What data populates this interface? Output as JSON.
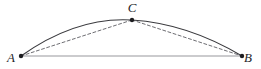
{
  "figure": {
    "kind": "geometry-diagram",
    "background_color": "#ffffff",
    "width": 261,
    "height": 69,
    "points": [
      {
        "id": "A",
        "label": "A",
        "x": 21,
        "y": 56,
        "label_x": 11,
        "label_y": 62,
        "marker": "filled-dot"
      },
      {
        "id": "B",
        "label": "B",
        "x": 242,
        "y": 56,
        "label_x": 248,
        "label_y": 62,
        "marker": "filled-dot"
      },
      {
        "id": "C",
        "label": "C",
        "x": 132,
        "y": 20,
        "label_x": 132,
        "label_y": 12,
        "marker": "filled-dot"
      }
    ],
    "edges": [
      {
        "id": "arc-ACB",
        "name": "arc-a-c-b",
        "style": "solid",
        "from": "A",
        "to": "B",
        "through": "C",
        "color": "#3a3a3e",
        "width": 1.1,
        "path": "M 21 56 Q 76.5 16.5 132 20 Q 187.5 23.5 242 56"
      },
      {
        "id": "chord-AC",
        "name": "chord-a-c",
        "style": "dashed",
        "from": "A",
        "to": "C",
        "color": "#6e6e73",
        "width": 1.0,
        "dash": "3 2.4",
        "path": "M 21 56 L 132 20"
      },
      {
        "id": "chord-CB",
        "name": "chord-c-b",
        "style": "dashed",
        "from": "C",
        "to": "B",
        "color": "#6e6e73",
        "width": 1.0,
        "dash": "3 2.4",
        "path": "M 132 20 L 242 56"
      },
      {
        "id": "segment-AB",
        "name": "segment-a-b",
        "style": "solid",
        "from": "A",
        "to": "B",
        "color": "#97979c",
        "width": 1.0,
        "path": "M 21 56 L 242 56"
      }
    ],
    "marker": {
      "radius": 2.2,
      "color": "#1d1d20"
    }
  }
}
